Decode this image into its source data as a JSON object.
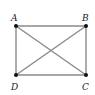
{
  "diagram": {
    "type": "rectangle-with-diagonals",
    "points": {
      "A": {
        "label": "A",
        "x": 16,
        "y": 26
      },
      "B": {
        "label": "B",
        "x": 86,
        "y": 26
      },
      "C": {
        "label": "C",
        "x": 86,
        "y": 75
      },
      "D": {
        "label": "D",
        "x": 16,
        "y": 75
      }
    },
    "segments": [
      "AB",
      "BC",
      "CD",
      "DA",
      "AC",
      "BD"
    ],
    "colors": {
      "line": "#8a8a8a",
      "point": "#111111",
      "label": "#222222"
    }
  }
}
